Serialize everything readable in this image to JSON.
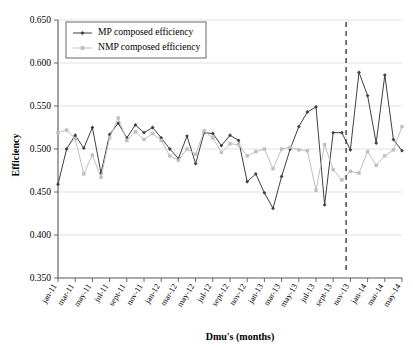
{
  "chart_data": {
    "type": "line",
    "title": "",
    "xlabel": "Dmu's (months)",
    "ylabel": "Efficiency",
    "ylim": [
      0.35,
      0.65
    ],
    "ytick_labels": [
      "0.350",
      "0.400",
      "0.450",
      "0.500",
      "0.550",
      "0.600",
      "0.650"
    ],
    "ytick_values": [
      0.35,
      0.4,
      0.45,
      0.5,
      0.55,
      0.6,
      0.65
    ],
    "grid": true,
    "legend_position": "top-left",
    "x": [
      "jan-11",
      "feb-11",
      "mar-11",
      "apr-11",
      "may-11",
      "jun-11",
      "jul-11",
      "ago-11",
      "sept-11",
      "oct-11",
      "nov-11",
      "dec-11",
      "jan-12",
      "feb-12",
      "mar-12",
      "apr-12",
      "may-12",
      "jun-12",
      "jul-12",
      "ago-12",
      "sept-12",
      "oct-12",
      "nov-12",
      "dec-12",
      "jan-13",
      "feb-13",
      "mar-13",
      "apr-13",
      "may-13",
      "jun-13",
      "jul-13",
      "ago-13",
      "sept-13",
      "oct-13",
      "nov-13",
      "dec-13",
      "jan-14",
      "feb-14",
      "mar-14",
      "apr-14",
      "may-14"
    ],
    "xtick_labels": [
      "jan-11",
      "mar-11",
      "may-11",
      "jul-11",
      "sept-11",
      "nov-11",
      "jan-12",
      "mar-12",
      "may-12",
      "jul-12",
      "sept-12",
      "nov-12",
      "jan-13",
      "mar-13",
      "may-13",
      "jul-13",
      "sept-13",
      "nov-13",
      "jan-14",
      "mar-14",
      "may-14"
    ],
    "series": [
      {
        "name": "MP composed efficiency",
        "color": "#404040",
        "marker": "diamond",
        "values": [
          0.459,
          0.5,
          0.516,
          0.501,
          0.525,
          0.472,
          0.517,
          0.53,
          0.513,
          0.528,
          0.519,
          0.525,
          0.513,
          0.5,
          0.489,
          0.515,
          0.483,
          0.519,
          0.518,
          0.504,
          0.516,
          0.51,
          0.462,
          0.471,
          0.449,
          0.431,
          0.468,
          0.5,
          0.526,
          0.543,
          0.549,
          0.435,
          0.519,
          0.519,
          0.499,
          0.589,
          0.562,
          0.507,
          0.586,
          0.511,
          0.498
        ]
      },
      {
        "name": "NMP composed efficiency",
        "color": "#bfbfbf",
        "marker": "square",
        "values": [
          0.519,
          0.522,
          0.512,
          0.471,
          0.493,
          0.467,
          0.513,
          0.536,
          0.51,
          0.52,
          0.511,
          0.518,
          0.51,
          0.492,
          0.487,
          0.5,
          0.494,
          0.521,
          0.513,
          0.496,
          0.506,
          0.505,
          0.492,
          0.497,
          0.5,
          0.477,
          0.5,
          0.502,
          0.499,
          0.498,
          0.452,
          0.505,
          0.476,
          0.464,
          0.474,
          0.472,
          0.497,
          0.481,
          0.492,
          0.499,
          0.526
        ]
      }
    ],
    "annotations": [
      {
        "name": "period-divider",
        "type": "vertical-dashed-line",
        "x_position": "between oct-13 and nov-13",
        "x_index": 33.5
      }
    ]
  }
}
